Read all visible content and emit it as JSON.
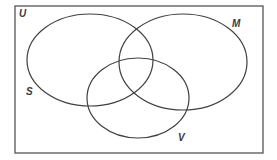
{
  "diagram": {
    "type": "venn",
    "universe": {
      "label": "U",
      "x": 15,
      "y": 6,
      "width": 248,
      "height": 147
    },
    "sets": [
      {
        "id": "S",
        "label": "S",
        "cx": 90,
        "cy": 60,
        "rx": 63,
        "ry": 46,
        "label_x": 26,
        "label_y": 87
      },
      {
        "id": "M",
        "label": "M",
        "cx": 183,
        "cy": 62,
        "rx": 64,
        "ry": 48,
        "label_x": 232,
        "label_y": 19
      },
      {
        "id": "V",
        "label": "V",
        "cx": 138,
        "cy": 98,
        "rx": 51,
        "ry": 40,
        "label_x": 178,
        "label_y": 133
      }
    ],
    "stroke_color": "#404040",
    "border_color": "#555555"
  }
}
